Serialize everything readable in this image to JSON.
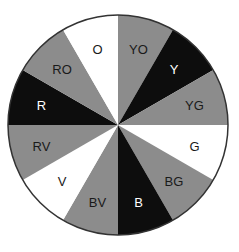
{
  "diagram": {
    "type": "color-wheel",
    "center": [
      118,
      125
    ],
    "radius": 110,
    "segments": [
      {
        "label": "YO",
        "fill": "#8c8c8c",
        "text": "#1a1a1a"
      },
      {
        "label": "Y",
        "fill": "#0d0d0d",
        "text": "#ffffff"
      },
      {
        "label": "YG",
        "fill": "#8c8c8c",
        "text": "#1a1a1a"
      },
      {
        "label": "G",
        "fill": "#ffffff",
        "text": "#1a1a1a"
      },
      {
        "label": "BG",
        "fill": "#8c8c8c",
        "text": "#1a1a1a"
      },
      {
        "label": "B",
        "fill": "#0d0d0d",
        "text": "#ffffff"
      },
      {
        "label": "BV",
        "fill": "#8c8c8c",
        "text": "#1a1a1a"
      },
      {
        "label": "V",
        "fill": "#ffffff",
        "text": "#1a1a1a"
      },
      {
        "label": "RV",
        "fill": "#8c8c8c",
        "text": "#1a1a1a"
      },
      {
        "label": "R",
        "fill": "#0d0d0d",
        "text": "#ffffff"
      },
      {
        "label": "RO",
        "fill": "#8c8c8c",
        "text": "#1a1a1a"
      },
      {
        "label": "O",
        "fill": "#ffffff",
        "text": "#1a1a1a"
      }
    ],
    "outline": "#333333"
  }
}
